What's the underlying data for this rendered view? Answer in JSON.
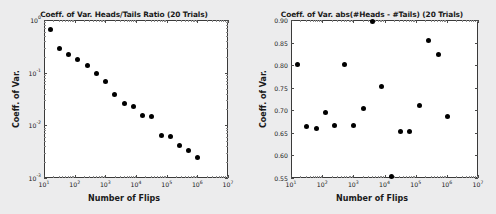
{
  "page": {
    "background_color": "#ececed",
    "panel_color": "#ffffff",
    "marker_color": "#000000",
    "axis_color": "#3a3a3a"
  },
  "chart_data": [
    {
      "id": "left",
      "type": "scatter",
      "title": "Coeff. of Var. Heads/Tails Ratio (20 Trials)",
      "xlabel": "Number of Flips",
      "ylabel": "Coeff. of Var.",
      "xscale": "log",
      "yscale": "log",
      "xlim": [
        10,
        10000000
      ],
      "ylim": [
        0.001,
        1
      ],
      "grid": false,
      "legend": null,
      "xticks": [
        "10^1",
        "10^2",
        "10^3",
        "10^4",
        "10^5",
        "10^6",
        "10^7"
      ],
      "xtick_labels": [
        "10",
        "10",
        "10",
        "10",
        "10",
        "10",
        "10"
      ],
      "xtick_exponents": [
        "1",
        "2",
        "3",
        "4",
        "5",
        "6",
        "7"
      ],
      "ytick_labels": [
        "10",
        "10",
        "10",
        "10"
      ],
      "ytick_exponents": [
        "0",
        "-1",
        "-2",
        "-3"
      ],
      "ytick_values": [
        1,
        0.1,
        0.01,
        0.001
      ],
      "x": [
        16,
        32,
        64,
        128,
        256,
        512,
        1024,
        2048,
        4096,
        8192,
        16384,
        32768,
        65536,
        131072,
        262144,
        524288,
        1048576
      ],
      "y": [
        0.66,
        0.29,
        0.225,
        0.175,
        0.135,
        0.0975,
        0.069,
        0.038,
        0.0255,
        0.0225,
        0.0152,
        0.0147,
        0.0063,
        0.0062,
        0.0042,
        0.0034,
        0.0024
      ],
      "n_points": 17
    },
    {
      "id": "right",
      "type": "scatter",
      "title": "Coeff. of Var. abs(#Heads - #Tails) (20 Trials)",
      "xlabel": "Number of Flips",
      "ylabel": "Coeff. of Var.",
      "xscale": "log",
      "yscale": "linear",
      "xlim": [
        10,
        10000000
      ],
      "ylim": [
        0.55,
        0.9
      ],
      "grid": false,
      "legend": null,
      "xtick_labels": [
        "10",
        "10",
        "10",
        "10",
        "10",
        "10",
        "10"
      ],
      "xtick_exponents": [
        "1",
        "2",
        "3",
        "4",
        "5",
        "6",
        "7"
      ],
      "ytick_labels": [
        "0.55",
        "0.60",
        "0.65",
        "0.70",
        "0.75",
        "0.80",
        "0.85",
        "0.90"
      ],
      "ytick_values": [
        0.55,
        0.6,
        0.65,
        0.7,
        0.75,
        0.8,
        0.85,
        0.9
      ],
      "x": [
        16,
        32,
        64,
        128,
        256,
        512,
        1024,
        2048,
        4096,
        8192,
        16384,
        32768,
        65536,
        131072,
        262144,
        524288,
        1048576
      ],
      "y": [
        0.801,
        0.663,
        0.66,
        0.694,
        0.667,
        0.801,
        0.667,
        0.704,
        0.897,
        0.753,
        0.554,
        0.654,
        0.652,
        0.711,
        0.854,
        0.823,
        0.687
      ],
      "n_points": 17
    }
  ]
}
